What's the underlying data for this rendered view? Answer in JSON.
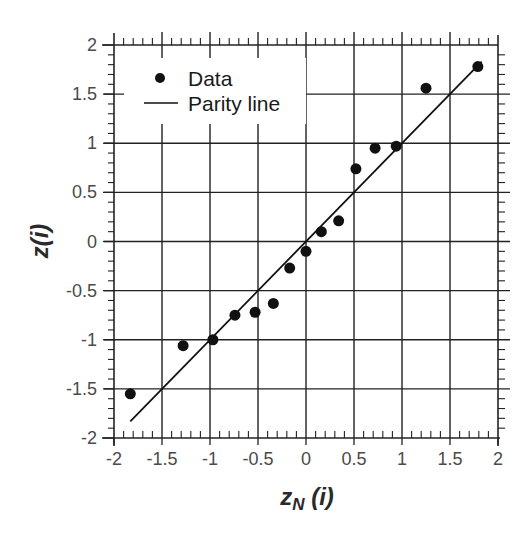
{
  "chart_data": {
    "type": "scatter",
    "title": "",
    "xlabel": "z_N (i)",
    "xlabel_main": "z",
    "xlabel_sub": "N",
    "xlabel_tail": " (i)",
    "ylabel": "z(i)",
    "xlim": [
      -2,
      2
    ],
    "ylim": [
      -2,
      2
    ],
    "grid": true,
    "legend_position": "upper left",
    "x_ticks": [
      "-2",
      "-1.5",
      "-1",
      "-0.5",
      "0",
      "0.5",
      "1",
      "1.5",
      "2"
    ],
    "y_ticks": [
      "2",
      "1.5",
      "1",
      "0.5",
      "0",
      "-0.5",
      "-1",
      "-1.5",
      "-2"
    ],
    "series": [
      {
        "name": "Data",
        "type": "scatter",
        "marker": "filled-circle",
        "color": "#111111",
        "x": [
          -1.83,
          -1.28,
          -0.97,
          -0.74,
          -0.53,
          -0.34,
          -0.17,
          0.0,
          0.16,
          0.34,
          0.52,
          0.72,
          0.94,
          1.25,
          1.79
        ],
        "y": [
          -1.55,
          -1.06,
          -1.0,
          -0.75,
          -0.72,
          -0.63,
          -0.27,
          -0.1,
          0.1,
          0.21,
          0.74,
          0.95,
          0.97,
          1.56,
          1.78
        ]
      },
      {
        "name": "Parity line",
        "type": "line",
        "color": "#111111",
        "x": [
          -1.83,
          1.83
        ],
        "y": [
          -1.83,
          1.83
        ]
      }
    ]
  },
  "legend": {
    "items": [
      {
        "label": "Data"
      },
      {
        "label": "Parity line"
      }
    ]
  }
}
